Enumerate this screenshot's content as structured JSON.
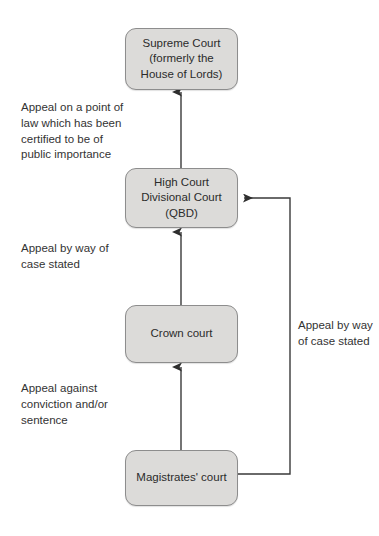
{
  "diagram": {
    "background_color": "#ffffff",
    "node_fill": "#dcdbd9",
    "node_border": "#8d8d8d",
    "connector_color": "#3a3a3a",
    "nodes": [
      {
        "id": "supreme",
        "label": "Supreme Court\n(formerly the\nHouse of Lords)"
      },
      {
        "id": "highcourt",
        "label": "High Court\nDivisional Court\n(QBD)"
      },
      {
        "id": "crown",
        "label": "Crown court"
      },
      {
        "id": "mags",
        "label": "Magistrates' court"
      }
    ],
    "annotations": [
      {
        "id": "supreme_note",
        "text": "Appeal on a point of\nlaw which has been\ncertified to be of\npublic importance"
      },
      {
        "id": "high_note",
        "text": "Appeal by way of\ncase stated"
      },
      {
        "id": "crown_note",
        "text": "Appeal against\nconviction and/or\nsentence"
      },
      {
        "id": "right_note",
        "text": "Appeal by way\nof case stated"
      }
    ],
    "connectors": [
      {
        "id": "crown-to-supreme-upper",
        "from": "highcourt",
        "to": "supreme",
        "direction": "up",
        "style": "straight"
      },
      {
        "id": "crown-to-highcourt",
        "from": "crown",
        "to": "highcourt",
        "direction": "up",
        "style": "straight"
      },
      {
        "id": "mags-to-crown",
        "from": "mags",
        "to": "crown",
        "direction": "up",
        "style": "straight"
      },
      {
        "id": "mags-to-highcourt",
        "from": "mags",
        "to": "highcourt",
        "direction": "left",
        "style": "elbow-right"
      }
    ]
  }
}
